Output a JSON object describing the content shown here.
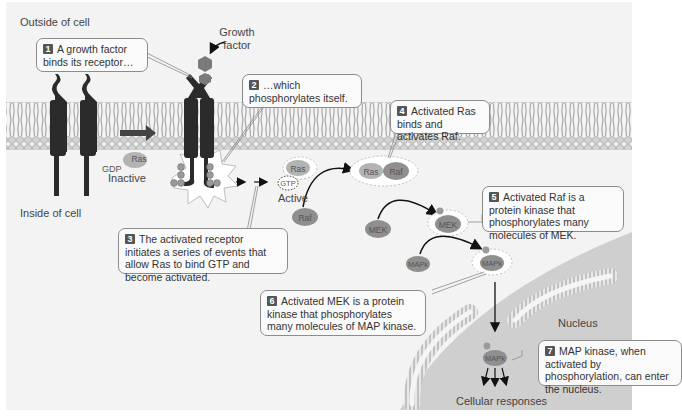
{
  "figure": {
    "regions": {
      "outside": "Outside of cell",
      "inside": "Inside of cell",
      "nucleus": "Nucleus",
      "responses": "Cellular responses"
    },
    "labels": {
      "growth_factor": "Growth factor",
      "inactive": "Inactive",
      "active": "Active"
    },
    "molecules": {
      "ras": "Ras",
      "gdp": "GDP",
      "gtp": "GTP",
      "raf": "Raf",
      "mek": "MEK",
      "mapk": "MAPk",
      "phosphate": "P"
    },
    "steps": [
      {
        "number": "1",
        "text": "A growth factor binds its receptor…"
      },
      {
        "number": "2",
        "text": "…which phosphorylates itself."
      },
      {
        "number": "3",
        "text": "The activated receptor initiates a series of events that allow Ras to bind GTP and become activated."
      },
      {
        "number": "4",
        "text": "Activated Ras binds and activates Raf."
      },
      {
        "number": "5",
        "text": "Activated Raf is a protein kinase that phosphorylates many molecules of MEK."
      },
      {
        "number": "6",
        "text": "Activated MEK is a protein kinase that phosphorylates many molecules of MAP kinase."
      },
      {
        "number": "7",
        "text": "MAP kinase, when activated by phosphorylation, can enter the nucleus."
      }
    ],
    "colors": {
      "background": "#f3f3f3",
      "membrane_head": "#d0d0d0",
      "membrane_tail": "#a9a9a9",
      "receptor": "#2b2b2b",
      "protein": "#8f8f8f",
      "protein_light": "#b3b3b3",
      "nucleus": "#cfcfcf",
      "badge": "#555555"
    }
  }
}
